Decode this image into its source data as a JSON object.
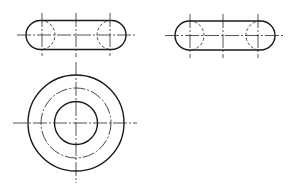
{
  "colors": {
    "background": "#ffffff",
    "line": "#1a1a1a"
  },
  "views": {
    "top_left_slot": {
      "x1": 26,
      "x2": 126,
      "cy": 35,
      "r": 14.5,
      "verticals": [
        42,
        76,
        110
      ],
      "vertical_span": [
        13,
        56
      ],
      "middle_vertical_span": [
        13,
        57
      ],
      "centerline_span": [
        17,
        135
      ]
    },
    "top_right_slot": {
      "x1": 175,
      "x2": 275,
      "cy": 35.5,
      "r": 14.5,
      "verticals": [
        190,
        223,
        258
      ],
      "vertical_span": [
        14,
        58
      ],
      "centerline_span": [
        165,
        284
      ]
    },
    "bottom_circle": {
      "cx": 76,
      "cy": 123,
      "outer_r": 48,
      "pitch_r": 35,
      "inner_r": 21.5,
      "h_span": [
        13,
        137
      ],
      "v_span": [
        62,
        183
      ]
    }
  }
}
